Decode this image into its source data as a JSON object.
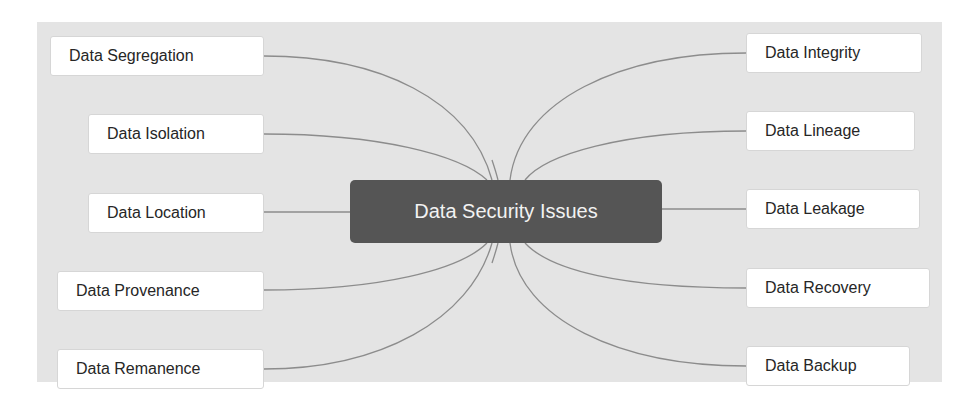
{
  "diagram": {
    "type": "mind-map",
    "colors": {
      "background": "#ffffff",
      "panel": "#e4e4e4",
      "center_fill": "#555555",
      "center_text": "#f2f2f2",
      "node_fill": "#ffffff",
      "node_text": "#262626",
      "connector": "#8c8c8c"
    },
    "center": {
      "label": "Data Security Issues"
    },
    "left_nodes": [
      {
        "label": "Data Segregation"
      },
      {
        "label": "Data Isolation"
      },
      {
        "label": "Data Location"
      },
      {
        "label": "Data Provenance"
      },
      {
        "label": "Data Remanence"
      }
    ],
    "right_nodes": [
      {
        "label": "Data Integrity"
      },
      {
        "label": "Data Lineage"
      },
      {
        "label": "Data Leakage"
      },
      {
        "label": "Data Recovery"
      },
      {
        "label": "Data Backup"
      }
    ]
  }
}
